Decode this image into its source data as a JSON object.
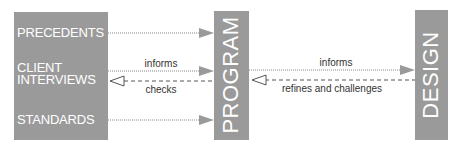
{
  "diagram": {
    "inputs": [
      {
        "id": "precedents",
        "label": "PRECEDENTS"
      },
      {
        "id": "client",
        "label": "CLIENT\nINTERVIEWS"
      },
      {
        "id": "standards",
        "label": "STANDARDS"
      }
    ],
    "program": {
      "label": "PROGRAM"
    },
    "design": {
      "label": "DESIGN"
    },
    "edges": [
      {
        "from": "PRECEDENTS",
        "to": "PROGRAM",
        "label": "",
        "style": "dotted",
        "head": "filled"
      },
      {
        "from": "CLIENT INTERVIEWS",
        "to": "PROGRAM",
        "label": "informs",
        "style": "dotted",
        "head": "filled"
      },
      {
        "from": "PROGRAM",
        "to": "CLIENT INTERVIEWS",
        "label": "checks",
        "style": "dashed",
        "head": "hollow"
      },
      {
        "from": "STANDARDS",
        "to": "PROGRAM",
        "label": "",
        "style": "dotted",
        "head": "filled"
      },
      {
        "from": "PROGRAM",
        "to": "DESIGN",
        "label": "informs",
        "style": "dotted",
        "head": "filled"
      },
      {
        "from": "DESIGN",
        "to": "PROGRAM",
        "label": "refines and challenges",
        "style": "dashed",
        "head": "hollow"
      }
    ],
    "labels": {
      "client_informs": "informs",
      "checks": "checks",
      "program_informs": "informs",
      "refines": "refines and challenges"
    },
    "colors": {
      "box_fill": "#9a9a9a",
      "box_text": "#ffffff",
      "arrow": "#8a8a8a",
      "label_text": "#333333"
    }
  }
}
